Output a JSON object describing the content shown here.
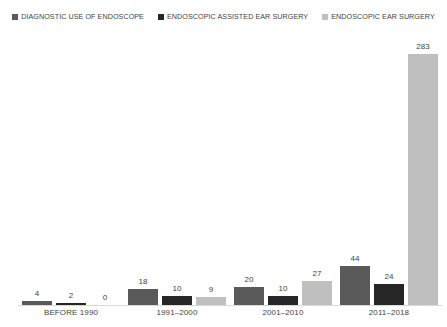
{
  "chart_data": {
    "type": "bar",
    "title": "NUMBER OF USE OF ENDOSCOPE IN EAR SURGERY",
    "xlabel": "",
    "ylabel": "",
    "grid": false,
    "legend_position": "top",
    "ylim": [
      0,
      310
    ],
    "categories": [
      "BEFORE 1990",
      "1991–2000",
      "2001–2010",
      "2011–2018"
    ],
    "series": [
      {
        "name": "DIAGNOSTIC USE OF ENDOSCOPE",
        "color": "#595959",
        "values": [
          4,
          18,
          20,
          44
        ],
        "labels": [
          "4",
          "18",
          "20",
          "44"
        ]
      },
      {
        "name": "ENDOSCOPIC ASSISTED EAR SURGERY",
        "color": "#262626",
        "values": [
          2,
          10,
          10,
          24
        ],
        "labels": [
          "2",
          "10",
          "10",
          "24"
        ]
      },
      {
        "name": "ENDOSCOPIC EAR SURGERY",
        "color": "#bfbfbf",
        "values": [
          0,
          9,
          27,
          283
        ],
        "labels": [
          "0",
          "9",
          "27",
          "283"
        ]
      }
    ]
  },
  "legend": {
    "items": [
      {
        "label": "DIAGNOSTIC USE OF ENDOSCOPE",
        "color": "#595959"
      },
      {
        "label": "ENDOSCOPIC ASSISTED EAR SURGERY",
        "color": "#262626"
      },
      {
        "label": "ENDOSCOPIC EAR SURGERY",
        "color": "#bfbfbf"
      }
    ]
  },
  "axis": {
    "tick_labels": [
      "BEFORE 1990",
      "1991–2000",
      "2001–2010",
      "2011–2018"
    ]
  }
}
